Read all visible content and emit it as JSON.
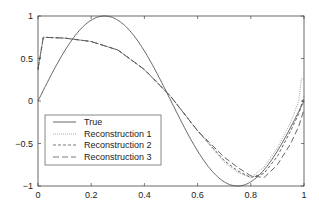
{
  "chart_data": {
    "type": "line",
    "title": "",
    "xlabel": "",
    "ylabel": "",
    "xlim": [
      0,
      1
    ],
    "ylim": [
      -1,
      1
    ],
    "grid": false,
    "legend_position": "lower left",
    "x_ticks": [
      0,
      0.2,
      0.4,
      0.6,
      0.8,
      1
    ],
    "x_tick_labels": [
      "0",
      "0.2",
      "0.4",
      "0.6",
      "0.8",
      "1"
    ],
    "y_ticks": [
      -1,
      -0.5,
      0,
      0.5,
      1
    ],
    "y_tick_labels": [
      "−1",
      "−0.5",
      "0",
      "0.5",
      "1"
    ],
    "series": [
      {
        "name": "True",
        "style": "solid",
        "color": "#555555",
        "x": [
          0,
          0.05,
          0.1,
          0.15,
          0.2,
          0.25,
          0.3,
          0.35,
          0.4,
          0.45,
          0.5,
          0.55,
          0.6,
          0.65,
          0.7,
          0.75,
          0.8,
          0.85,
          0.9,
          0.95,
          1.0
        ],
        "values": [
          0,
          0.309,
          0.588,
          0.809,
          0.951,
          1.0,
          0.951,
          0.809,
          0.588,
          0.309,
          0,
          -0.309,
          -0.588,
          -0.809,
          -0.951,
          -1.0,
          -0.951,
          -0.809,
          -0.588,
          -0.309,
          0
        ]
      },
      {
        "name": "Reconstruction 1",
        "style": "dotted",
        "color": "#777777",
        "x": [
          0,
          0.02,
          0.1,
          0.2,
          0.3,
          0.4,
          0.5,
          0.6,
          0.7,
          0.75,
          0.8,
          0.85,
          0.9,
          0.95,
          0.98,
          0.99,
          1.0
        ],
        "values": [
          0.37,
          0.75,
          0.74,
          0.7,
          0.6,
          0.37,
          0.05,
          -0.35,
          -0.72,
          -0.84,
          -0.9,
          -0.78,
          -0.55,
          -0.25,
          0.0,
          0.26,
          0.26
        ]
      },
      {
        "name": "Reconstruction 2",
        "style": "dashed-short",
        "color": "#555555",
        "x": [
          0,
          0.02,
          0.1,
          0.2,
          0.3,
          0.4,
          0.5,
          0.6,
          0.7,
          0.75,
          0.8,
          0.85,
          0.9,
          0.95,
          0.98,
          1.0
        ],
        "values": [
          0.37,
          0.75,
          0.74,
          0.7,
          0.6,
          0.37,
          0.05,
          -0.35,
          -0.7,
          -0.82,
          -0.9,
          -0.85,
          -0.65,
          -0.35,
          -0.15,
          0.05
        ]
      },
      {
        "name": "Reconstruction 3",
        "style": "dashed-long",
        "color": "#555555",
        "x": [
          0,
          0.02,
          0.1,
          0.2,
          0.3,
          0.4,
          0.5,
          0.6,
          0.7,
          0.75,
          0.8,
          0.85,
          0.9,
          0.95,
          0.98,
          1.0
        ],
        "values": [
          0.37,
          0.75,
          0.74,
          0.7,
          0.6,
          0.37,
          0.05,
          -0.35,
          -0.66,
          -0.78,
          -0.88,
          -0.9,
          -0.75,
          -0.5,
          -0.3,
          -0.1
        ]
      }
    ]
  },
  "legend": {
    "items": [
      {
        "label": "True"
      },
      {
        "label": "Reconstruction 1"
      },
      {
        "label": "Reconstruction 2"
      },
      {
        "label": "Reconstruction 3"
      }
    ]
  }
}
